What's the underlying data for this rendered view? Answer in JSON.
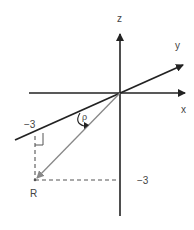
{
  "diagram": {
    "type": "3d-coordinate-axes",
    "axes": {
      "x": {
        "label": "x"
      },
      "y": {
        "label": "y"
      },
      "z": {
        "label": "z"
      }
    },
    "point": {
      "label": "R"
    },
    "angle": {
      "label": "ρ"
    },
    "ticks": {
      "y_neg": "−3",
      "z_neg": "−3"
    },
    "colors": {
      "axis": "#222222",
      "vector": "#888888",
      "dashed": "#555555",
      "text": "#444444"
    }
  }
}
